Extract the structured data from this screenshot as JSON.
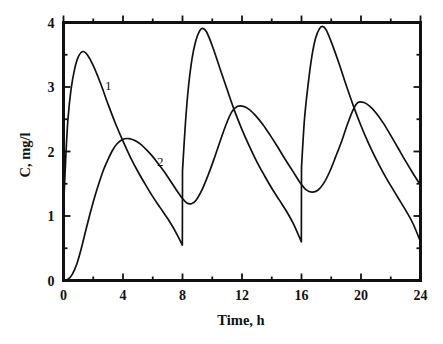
{
  "chart_data": {
    "type": "line",
    "title": "",
    "subtitle": "",
    "xlabel": "Time, h",
    "ylabel": "C, mg/l",
    "xlim": [
      0,
      24
    ],
    "ylim": [
      0,
      4
    ],
    "grid": false,
    "legend_position": "inline-annotation",
    "x_major_ticks": [
      0,
      4,
      8,
      12,
      16,
      20,
      24
    ],
    "x_major_tick_labels": [
      "0",
      "4",
      "8",
      "12",
      "16",
      "20",
      "24"
    ],
    "x_minor_ticks": [
      2,
      6,
      10,
      14,
      18,
      22
    ],
    "y_major_ticks": [
      0,
      1,
      2,
      3,
      4
    ],
    "y_major_tick_labels": [
      "0",
      "1",
      "2",
      "3",
      "4"
    ],
    "y_minor_ticks": [
      0.5,
      1.5,
      2.5,
      3.5
    ],
    "annotations": [
      {
        "text": "1",
        "x": 3.0,
        "y": 2.95,
        "series": "1"
      },
      {
        "text": "2",
        "x": 6.5,
        "y": 1.78,
        "series": "2"
      }
    ],
    "series": [
      {
        "name": "1",
        "label": "1",
        "color": "#111111",
        "description": "Fast-absorbing drug: sharp rise to peak then decay, re-dosed every 8 h with sawtooth jumps",
        "points": [
          [
            0.0,
            1.1
          ],
          [
            0.15,
            1.9
          ],
          [
            0.3,
            2.5
          ],
          [
            0.5,
            2.95
          ],
          [
            0.75,
            3.28
          ],
          [
            1.0,
            3.47
          ],
          [
            1.3,
            3.55
          ],
          [
            1.6,
            3.5
          ],
          [
            2.0,
            3.33
          ],
          [
            2.5,
            3.05
          ],
          [
            3.0,
            2.73
          ],
          [
            3.5,
            2.43
          ],
          [
            4.0,
            2.16
          ],
          [
            4.5,
            1.91
          ],
          [
            5.0,
            1.69
          ],
          [
            5.5,
            1.49
          ],
          [
            6.0,
            1.3
          ],
          [
            6.5,
            1.13
          ],
          [
            7.0,
            0.96
          ],
          [
            7.5,
            0.77
          ],
          [
            7.99,
            0.55
          ],
          [
            8.0,
            1.7
          ],
          [
            8.2,
            2.45
          ],
          [
            8.4,
            3.0
          ],
          [
            8.65,
            3.45
          ],
          [
            8.9,
            3.72
          ],
          [
            9.15,
            3.87
          ],
          [
            9.35,
            3.91
          ],
          [
            9.6,
            3.86
          ],
          [
            10.0,
            3.64
          ],
          [
            10.5,
            3.3
          ],
          [
            11.0,
            2.96
          ],
          [
            11.5,
            2.63
          ],
          [
            12.0,
            2.34
          ],
          [
            12.5,
            2.08
          ],
          [
            13.0,
            1.84
          ],
          [
            13.5,
            1.63
          ],
          [
            14.0,
            1.43
          ],
          [
            14.5,
            1.25
          ],
          [
            15.0,
            1.07
          ],
          [
            15.5,
            0.86
          ],
          [
            15.99,
            0.6
          ],
          [
            16.0,
            1.75
          ],
          [
            16.2,
            2.5
          ],
          [
            16.45,
            3.05
          ],
          [
            16.7,
            3.48
          ],
          [
            16.95,
            3.76
          ],
          [
            17.2,
            3.9
          ],
          [
            17.4,
            3.94
          ],
          [
            17.65,
            3.89
          ],
          [
            18.0,
            3.7
          ],
          [
            18.5,
            3.38
          ],
          [
            19.0,
            3.03
          ],
          [
            19.5,
            2.7
          ],
          [
            20.0,
            2.4
          ],
          [
            20.5,
            2.13
          ],
          [
            21.0,
            1.89
          ],
          [
            21.5,
            1.67
          ],
          [
            22.0,
            1.47
          ],
          [
            22.5,
            1.28
          ],
          [
            23.0,
            1.09
          ],
          [
            23.5,
            0.88
          ],
          [
            24.0,
            0.6
          ]
        ]
      },
      {
        "name": "2",
        "label": "2",
        "color": "#111111",
        "description": "Slow-release drug: gradual rise from zero, lower smoother peaks, re-dosed every 8 h",
        "points": [
          [
            0.0,
            0.0
          ],
          [
            0.3,
            0.02
          ],
          [
            0.6,
            0.1
          ],
          [
            0.9,
            0.26
          ],
          [
            1.2,
            0.5
          ],
          [
            1.5,
            0.78
          ],
          [
            1.8,
            1.05
          ],
          [
            2.1,
            1.3
          ],
          [
            2.4,
            1.52
          ],
          [
            2.7,
            1.72
          ],
          [
            3.0,
            1.88
          ],
          [
            3.3,
            2.02
          ],
          [
            3.6,
            2.12
          ],
          [
            4.0,
            2.19
          ],
          [
            4.4,
            2.2
          ],
          [
            4.8,
            2.17
          ],
          [
            5.2,
            2.11
          ],
          [
            5.6,
            2.02
          ],
          [
            6.0,
            1.92
          ],
          [
            6.4,
            1.8
          ],
          [
            6.8,
            1.68
          ],
          [
            7.2,
            1.54
          ],
          [
            7.6,
            1.4
          ],
          [
            8.0,
            1.27
          ],
          [
            8.3,
            1.2
          ],
          [
            8.6,
            1.19
          ],
          [
            8.9,
            1.24
          ],
          [
            9.3,
            1.4
          ],
          [
            9.7,
            1.62
          ],
          [
            10.1,
            1.87
          ],
          [
            10.5,
            2.14
          ],
          [
            10.9,
            2.4
          ],
          [
            11.3,
            2.61
          ],
          [
            11.7,
            2.7
          ],
          [
            12.1,
            2.7
          ],
          [
            12.5,
            2.65
          ],
          [
            12.9,
            2.56
          ],
          [
            13.4,
            2.42
          ],
          [
            13.9,
            2.25
          ],
          [
            14.4,
            2.07
          ],
          [
            14.9,
            1.88
          ],
          [
            15.4,
            1.7
          ],
          [
            15.9,
            1.52
          ],
          [
            16.3,
            1.41
          ],
          [
            16.7,
            1.37
          ],
          [
            17.1,
            1.4
          ],
          [
            17.5,
            1.51
          ],
          [
            17.9,
            1.69
          ],
          [
            18.3,
            1.92
          ],
          [
            18.7,
            2.16
          ],
          [
            19.1,
            2.43
          ],
          [
            19.5,
            2.66
          ],
          [
            19.8,
            2.76
          ],
          [
            20.2,
            2.76
          ],
          [
            20.6,
            2.7
          ],
          [
            21.0,
            2.6
          ],
          [
            21.5,
            2.44
          ],
          [
            22.0,
            2.25
          ],
          [
            22.5,
            2.05
          ],
          [
            23.0,
            1.85
          ],
          [
            23.5,
            1.66
          ],
          [
            24.0,
            1.48
          ]
        ]
      }
    ]
  },
  "figure": {
    "background_color": "#ffffff",
    "axis_color": "#111111",
    "curve_color": "#111111"
  }
}
